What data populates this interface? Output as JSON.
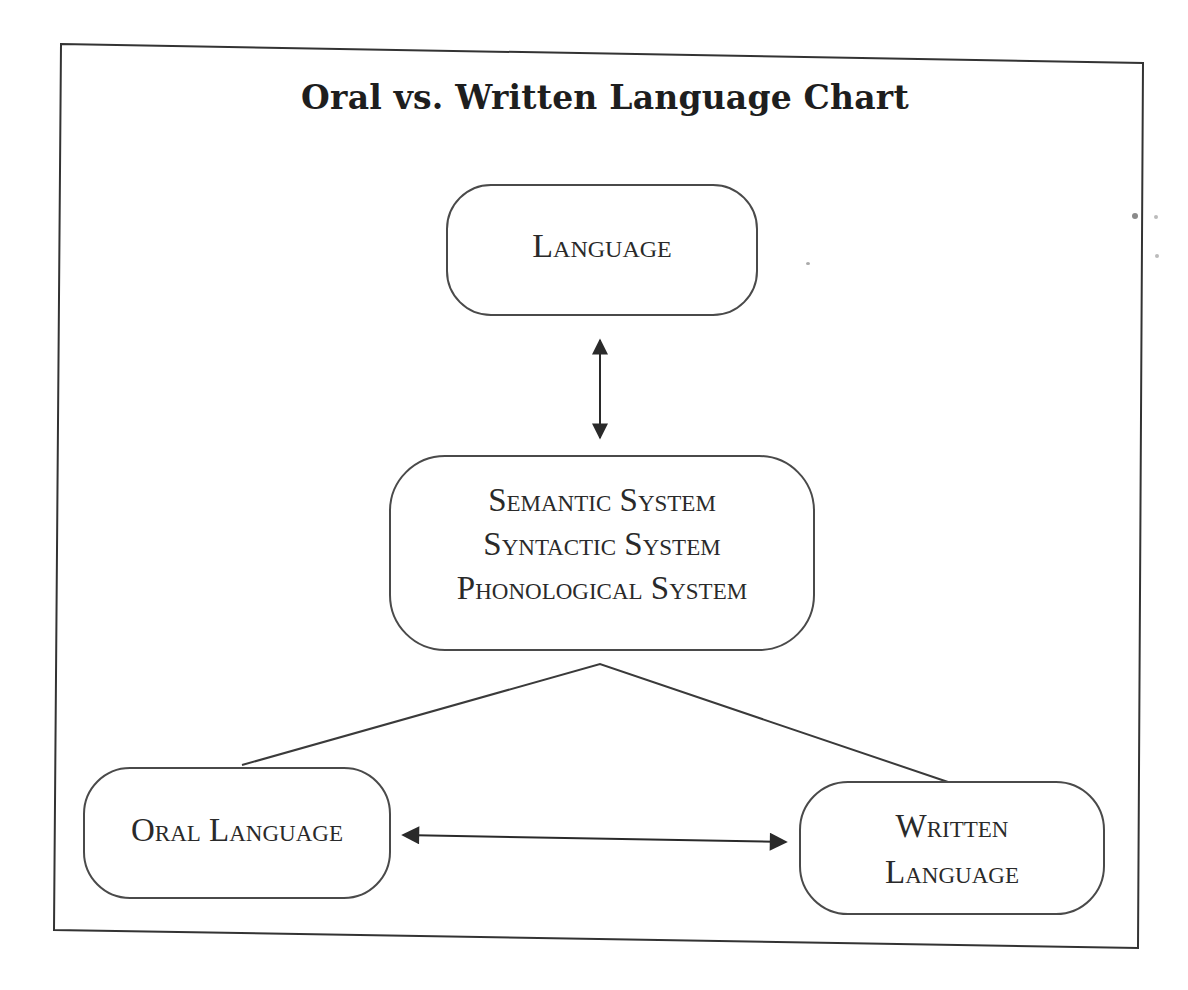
{
  "title": "Oral vs. Written Language Chart",
  "nodes": {
    "language": {
      "label": "Language"
    },
    "systems": {
      "lines": [
        "Semantic System",
        "Syntactic System",
        "Phonological System"
      ]
    },
    "oral": {
      "label": "Oral Language"
    },
    "written": {
      "lines": [
        "Written",
        "Language"
      ]
    }
  },
  "edges": [
    {
      "from": "language",
      "to": "systems",
      "type": "bidirectional-arrow"
    },
    {
      "from": "systems",
      "to": "oral",
      "type": "line"
    },
    {
      "from": "systems",
      "to": "written",
      "type": "line"
    },
    {
      "from": "oral",
      "to": "written",
      "type": "bidirectional-arrow"
    }
  ],
  "colors": {
    "ink": "#2a2a2a",
    "outline": "#4a4a4a",
    "background": "#ffffff"
  }
}
